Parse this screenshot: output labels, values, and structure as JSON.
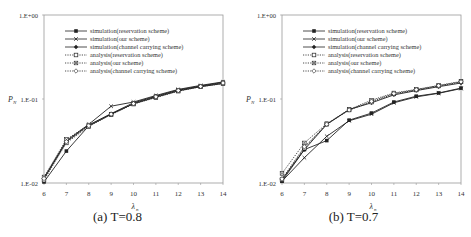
{
  "chart_data": [
    {
      "type": "line",
      "title": "",
      "caption": "(a) T=0.8",
      "xlabel": "λ_n",
      "ylabel": "P_N",
      "yscale": "log",
      "ylim": [
        0.01,
        1
      ],
      "xlim": [
        6,
        14
      ],
      "x": [
        6,
        7,
        8,
        9,
        10,
        11,
        12,
        13,
        14
      ],
      "xticks": [
        "6",
        "7",
        "8",
        "9",
        "10",
        "11",
        "12",
        "13",
        "14"
      ],
      "yticks": [
        "1.E-02",
        "1.E-01",
        "1.E+00"
      ],
      "grid": false,
      "legend_position": "upper-left inside",
      "series": [
        {
          "name": "simulation(reservation scheme)",
          "style": "solid",
          "marker": "square-filled",
          "values": [
            0.0103,
            0.024,
            0.048,
            0.066,
            0.088,
            0.105,
            0.125,
            0.14,
            0.153
          ]
        },
        {
          "name": "simulation(our scheme)",
          "style": "solid",
          "marker": "x",
          "values": [
            0.0115,
            0.032,
            0.05,
            0.082,
            0.092,
            0.11,
            0.13,
            0.145,
            0.16
          ]
        },
        {
          "name": "simulation(channel carrying scheme)",
          "style": "solid",
          "marker": "diamond-filled",
          "values": [
            0.0112,
            0.031,
            0.049,
            0.067,
            0.09,
            0.108,
            0.128,
            0.143,
            0.158
          ]
        },
        {
          "name": "analysis(reservation scheme)",
          "style": "dotted",
          "marker": "square-open",
          "values": [
            0.0108,
            0.03,
            0.047,
            0.065,
            0.087,
            0.104,
            0.124,
            0.14,
            0.152
          ]
        },
        {
          "name": "analysis(our scheme)",
          "style": "dotted",
          "marker": "x-box",
          "values": [
            0.0118,
            0.033,
            0.049,
            0.066,
            0.089,
            0.107,
            0.127,
            0.142,
            0.156
          ]
        },
        {
          "name": "analysis(channel carrying scheme)",
          "style": "dotted",
          "marker": "diamond-open",
          "values": [
            0.0113,
            0.031,
            0.048,
            0.066,
            0.088,
            0.106,
            0.126,
            0.141,
            0.155
          ]
        }
      ]
    },
    {
      "type": "line",
      "title": "",
      "caption": "(b) T=0.7",
      "xlabel": "λ_n",
      "ylabel": "P_N",
      "yscale": "log",
      "ylim": [
        0.01,
        1
      ],
      "xlim": [
        6,
        14
      ],
      "x": [
        6,
        7,
        8,
        9,
        10,
        11,
        12,
        13,
        14
      ],
      "xticks": [
        "6",
        "7",
        "8",
        "9",
        "10",
        "11",
        "12",
        "13",
        "14"
      ],
      "yticks": [
        "1.E-02",
        "1.E-01",
        "1.E+00"
      ],
      "grid": false,
      "legend_position": "upper-left inside",
      "series": [
        {
          "name": "simulation(reservation scheme)",
          "style": "solid",
          "marker": "square-filled",
          "values": [
            0.0105,
            0.025,
            0.032,
            0.056,
            0.068,
            0.092,
            0.108,
            0.118,
            0.135
          ]
        },
        {
          "name": "simulation(our scheme)",
          "style": "solid",
          "marker": "x",
          "values": [
            0.0105,
            0.02,
            0.036,
            0.055,
            0.066,
            0.09,
            0.106,
            0.117,
            0.133
          ]
        },
        {
          "name": "simulation(channel carrying scheme)",
          "style": "solid",
          "marker": "diamond-filled",
          "values": [
            0.011,
            0.025,
            0.05,
            0.075,
            0.09,
            0.112,
            0.126,
            0.14,
            0.155
          ]
        },
        {
          "name": "analysis(reservation scheme)",
          "style": "dotted",
          "marker": "square-open",
          "values": [
            0.011,
            0.026,
            0.05,
            0.074,
            0.092,
            0.115,
            0.128,
            0.143,
            0.16
          ]
        },
        {
          "name": "analysis(our scheme)",
          "style": "dotted",
          "marker": "x-box",
          "values": [
            0.013,
            0.03,
            0.051,
            0.075,
            0.097,
            0.118,
            0.13,
            0.145,
            0.162
          ]
        },
        {
          "name": "analysis(channel carrying scheme)",
          "style": "dotted",
          "marker": "diamond-open",
          "values": [
            0.0112,
            0.027,
            0.05,
            0.074,
            0.094,
            0.116,
            0.129,
            0.144,
            0.16
          ]
        }
      ]
    }
  ],
  "captions": {
    "a": "(a) T=0.8",
    "b": "(b) T=0.7"
  }
}
